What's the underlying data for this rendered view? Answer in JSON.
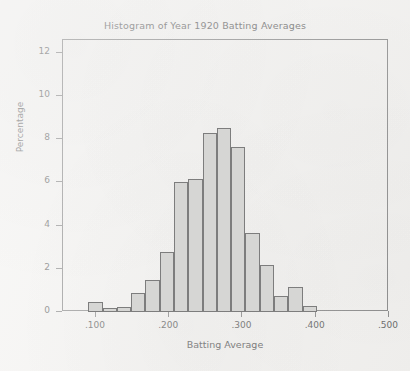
{
  "chart_data": {
    "type": "bar",
    "title": "Histogram of Year 1920 Batting Averages",
    "xlabel": "Batting Average",
    "ylabel": "Percentage",
    "xlim": [
      0.055,
      0.5
    ],
    "ylim": [
      0,
      12.6
    ],
    "grid": false,
    "legend": null,
    "xtick_labels": [
      ".100",
      ".200",
      ".300",
      ".400",
      ".500"
    ],
    "xtick_values": [
      0.1,
      0.2,
      0.3,
      0.4,
      0.5
    ],
    "ytick_labels": [
      "0",
      "2",
      "4",
      "6",
      "8",
      "10",
      "12"
    ],
    "ytick_values": [
      0,
      2,
      4,
      6,
      8,
      10,
      12
    ],
    "bin_width": 0.0195,
    "bins": [
      {
        "x0": 0.0895,
        "x1": 0.109,
        "value": 0.45
      },
      {
        "x0": 0.109,
        "x1": 0.1285,
        "value": 0.2
      },
      {
        "x0": 0.1285,
        "x1": 0.148,
        "value": 0.22
      },
      {
        "x0": 0.148,
        "x1": 0.1675,
        "value": 0.9
      },
      {
        "x0": 0.1675,
        "x1": 0.187,
        "value": 1.5
      },
      {
        "x0": 0.187,
        "x1": 0.2065,
        "value": 2.8
      },
      {
        "x0": 0.2065,
        "x1": 0.226,
        "value": 6.0
      },
      {
        "x0": 0.226,
        "x1": 0.2455,
        "value": 6.18
      },
      {
        "x0": 0.2455,
        "x1": 0.265,
        "value": 8.3
      },
      {
        "x0": 0.265,
        "x1": 0.2845,
        "value": 8.52
      },
      {
        "x0": 0.2845,
        "x1": 0.304,
        "value": 7.65
      },
      {
        "x0": 0.304,
        "x1": 0.3235,
        "value": 3.65
      },
      {
        "x0": 0.3235,
        "x1": 0.343,
        "value": 2.2
      },
      {
        "x0": 0.343,
        "x1": 0.3625,
        "value": 0.75
      },
      {
        "x0": 0.3625,
        "x1": 0.382,
        "value": 1.18
      },
      {
        "x0": 0.382,
        "x1": 0.4015,
        "value": 0.3
      }
    ],
    "colors": {
      "bar_fill": "#d6d6d4",
      "bar_edge": "#7d7d7d",
      "axis": "#8d8d8d",
      "text": "#6a6a6a",
      "background": "#f3f2f0"
    }
  }
}
